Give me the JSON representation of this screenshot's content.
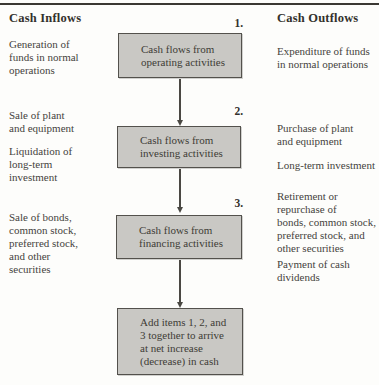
{
  "headers": {
    "inflows": "Cash Inflows",
    "outflows": "Cash Outflows"
  },
  "inflow_items": [
    "Generation of\nfunds in normal\noperations",
    "Sale of plant\nand equipment",
    "Liquidation of\nlong-term\ninvestment",
    "Sale of bonds,\ncommon stock,\npreferred stock,\nand other\nsecurities"
  ],
  "outflow_items": [
    "Expenditure of funds\nin normal operations",
    "Purchase of plant\nand equipment",
    "Long-term investment",
    "Retirement or\nrepurchase of\nbonds, common stock,\npreferred stock, and\nother securities",
    "Payment of cash\ndividends"
  ],
  "flow_boxes": [
    {
      "number": "1.",
      "label": "Cash flows from\noperating activities"
    },
    {
      "number": "2.",
      "label": "Cash flows from\ninvesting activities"
    },
    {
      "number": "3.",
      "label": "Cash flows from\nfinancing activities"
    },
    {
      "number": "",
      "label": "Add items 1, 2, and\n3 together to arrive\nat net increase\n(decrease) in cash"
    }
  ],
  "colors": {
    "box_fill": "#c9c8c4",
    "box_border": "#53514c",
    "text": "#45433d",
    "top_rule": "#3a3833",
    "background": "#fdfdfb"
  }
}
